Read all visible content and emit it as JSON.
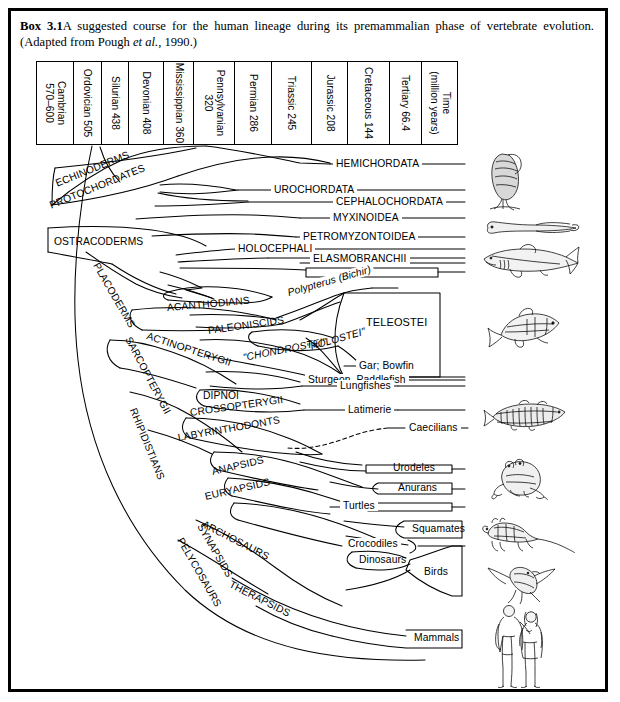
{
  "caption": {
    "box_number": "Box 3.1",
    "text_part1": "A suggested course for the human lineage during its premammalian phase of vertebrate evolution. (Adapted from Pough ",
    "italic": "et al.",
    "text_part2": ", 1990.)"
  },
  "time_scale": {
    "unit_label_line1": "Time",
    "unit_label_line2": "(million years)",
    "periods": [
      {
        "name": "Cambrian",
        "age": "570–600",
        "two_line": true
      },
      {
        "name": "Ordovician",
        "age": "505",
        "two_line": false
      },
      {
        "name": "Silurian",
        "age": "438",
        "two_line": false
      },
      {
        "name": "Devonian",
        "age": "408",
        "two_line": false
      },
      {
        "name": "Mississippian",
        "age": "360",
        "two_line": false
      },
      {
        "name": "Pennsylvanian",
        "age": "320",
        "two_line": true
      },
      {
        "name": "Permian",
        "age": "286",
        "two_line": false
      },
      {
        "name": "Triassic",
        "age": "245",
        "two_line": false
      },
      {
        "name": "Jurassic",
        "age": "208",
        "two_line": false
      },
      {
        "name": "Cretaceous",
        "age": "144",
        "two_line": false
      },
      {
        "name": "Tertiary",
        "age": "66.4",
        "two_line": false
      }
    ]
  },
  "chart_data": {
    "type": "diagram",
    "subtype": "cladogram",
    "title": "A suggested course for the human lineage during its premammalian phase of vertebrate evolution",
    "source": "Adapted from Pough et al., 1990",
    "x_axis": "geologic time (million years before present)",
    "taxa_labels": [
      {
        "text": "ECHINODERMS",
        "type": "stem-clade",
        "rotation": -22
      },
      {
        "text": "PROTOCHORDATES",
        "type": "stem-clade",
        "rotation": -22
      },
      {
        "text": "OSTRACODERMS",
        "type": "stem-clade",
        "rotation": 0
      },
      {
        "text": "PLACODERMS",
        "type": "stem-clade",
        "rotation": 60
      },
      {
        "text": "ACANTHODIANS",
        "type": "stem-clade",
        "rotation": -6
      },
      {
        "text": "SARCOPTERYGII",
        "type": "stem-clade",
        "rotation": 62
      },
      {
        "text": "ACTINOPTERYGII",
        "type": "stem-clade",
        "rotation": 18
      },
      {
        "text": "PALEONISCIDS",
        "type": "stem-clade",
        "rotation": -8
      },
      {
        "text": "\"CHONDROSTEI\"",
        "type": "paraphyletic",
        "rotation": -12
      },
      {
        "text": "\"HOLOSTEI\"",
        "type": "paraphyletic",
        "rotation": -16
      },
      {
        "text": "RHIPIDISTIANS",
        "type": "stem-clade",
        "rotation": 68
      },
      {
        "text": "DIPNOI",
        "type": "stem-clade",
        "rotation": 0
      },
      {
        "text": "CROSSOPTERYGII",
        "type": "stem-clade",
        "rotation": -8
      },
      {
        "text": "LABYRINTHODONTS",
        "type": "stem-clade",
        "rotation": -10
      },
      {
        "text": "ANAPSIDS",
        "type": "stem-clade",
        "rotation": -14
      },
      {
        "text": "EURYAPSIDS",
        "type": "stem-clade",
        "rotation": -14
      },
      {
        "text": "ARCHOSAURS",
        "type": "stem-clade",
        "rotation": 26
      },
      {
        "text": "SYNAPSIDS",
        "type": "stem-clade",
        "rotation": 60
      },
      {
        "text": "PELYCOSAURS",
        "type": "stem-clade",
        "rotation": 60
      },
      {
        "text": "THERAPSIDS",
        "type": "stem-clade",
        "rotation": 26
      }
    ],
    "terminal_taxa": [
      {
        "text": "HEMICHORDATA",
        "boxed": false
      },
      {
        "text": "UROCHORDATA",
        "boxed": false
      },
      {
        "text": "CEPHALOCHORDATA",
        "boxed": false
      },
      {
        "text": "MYXINOIDEA",
        "boxed": false
      },
      {
        "text": "PETROMYZONTOIDEA",
        "boxed": false
      },
      {
        "text": "HOLOCEPHALI",
        "boxed": false
      },
      {
        "text": "ELASMOBRANCHII",
        "boxed": false
      },
      {
        "text": "Polypterus (Bichir)",
        "boxed": false,
        "italic_part": "Polypterus"
      },
      {
        "text": "TELEOSTEI",
        "boxed": true
      },
      {
        "text": "Gar; Bowfin",
        "boxed": false
      },
      {
        "text": "Sturgeon, Paddlefish",
        "boxed": false
      },
      {
        "text": "Lungfishes",
        "boxed": false
      },
      {
        "text": "Latimerie",
        "boxed": false
      },
      {
        "text": "Caecilians",
        "boxed": false,
        "dashed_branch": true
      },
      {
        "text": "Urodeles",
        "boxed": true
      },
      {
        "text": "Anurans",
        "boxed": true
      },
      {
        "text": "Turtles",
        "boxed": true
      },
      {
        "text": "Squamates",
        "boxed": true
      },
      {
        "text": "Crocodiles",
        "boxed": false
      },
      {
        "text": "Dinosaurs",
        "boxed": true
      },
      {
        "text": "Birds",
        "boxed": true
      },
      {
        "text": "Mammals",
        "boxed": true
      }
    ],
    "illustrations": [
      {
        "name": "tunicate-sea-squirt",
        "aligned_to": "UROCHORDATA"
      },
      {
        "name": "hagfish-lamprey",
        "aligned_to": "MYXINOIDEA"
      },
      {
        "name": "shark",
        "aligned_to": "ELASMOBRANCHII"
      },
      {
        "name": "teleost-salmon",
        "aligned_to": "TELEOSTEI"
      },
      {
        "name": "coelacanth-latimeria",
        "aligned_to": "Latimerie"
      },
      {
        "name": "frog-anuran",
        "aligned_to": "Anurans"
      },
      {
        "name": "lizard-squamate",
        "aligned_to": "Squamates"
      },
      {
        "name": "bird",
        "aligned_to": "Birds"
      },
      {
        "name": "human-couple",
        "aligned_to": "Mammals"
      }
    ]
  }
}
